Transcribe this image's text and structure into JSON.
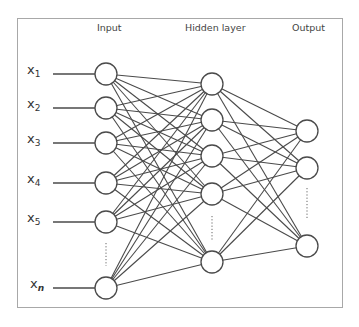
{
  "titles": {
    "input": "Input",
    "hidden": "Hidden layer",
    "output": "Output"
  },
  "input_labels": [
    {
      "base": "x",
      "sub": "1"
    },
    {
      "base": "x",
      "sub": "2"
    },
    {
      "base": "x",
      "sub": "3"
    },
    {
      "base": "x",
      "sub": "4"
    },
    {
      "base": "x",
      "sub": "5"
    },
    {
      "base": "x",
      "sub": "n"
    }
  ],
  "layers": {
    "input": {
      "x": 106,
      "r": 11,
      "ys": [
        74,
        108,
        143,
        183,
        222,
        288
      ],
      "ellipsis_y": [
        243,
        266
      ]
    },
    "hidden": {
      "x": 212,
      "r": 11,
      "ys": [
        84,
        120,
        156,
        194,
        262
      ],
      "ellipsis_y": [
        216,
        240
      ]
    },
    "output": {
      "x": 307,
      "r": 11,
      "ys": [
        131,
        168,
        246
      ],
      "ellipsis_y": [
        188,
        220
      ]
    }
  },
  "connectivity": "fully-connected",
  "colors": {
    "stroke": "#4a4a4a",
    "node_fill": "#ffffff",
    "frame": "#a8a8a8",
    "ellipsis": "#666666"
  }
}
